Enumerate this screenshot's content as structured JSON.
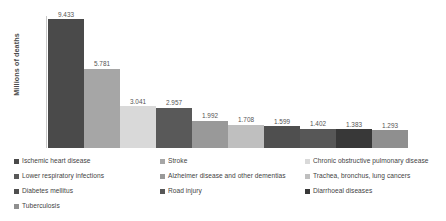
{
  "chart_data": {
    "type": "bar",
    "title": "",
    "subtitle": "",
    "xlabel": "",
    "ylabel": "Millions of deaths",
    "ylim": [
      0,
      10.5
    ],
    "grid": false,
    "legend_position": "bottom",
    "legend_columns": 3,
    "value_format": "decimal-comma-three",
    "categories": [
      "Ischemic heart disease",
      "Stroke",
      "Chronic obstructive pulmonary disease",
      "Lower respiratory infections",
      "Alzheimer disease and other dementias",
      "Trachea, bronchus, lung cancers",
      "Diabetes mellitus",
      "Road injury",
      "Diarrhoeal diseases",
      "Tuberculosis"
    ],
    "bars": [
      {
        "label": "Ischemic heart disease",
        "value": 9.433,
        "value_text": "9.433",
        "color": "#4a4a4a"
      },
      {
        "label": "Stroke",
        "value": 5.781,
        "value_text": "5.781",
        "color": "#a6a6a6"
      },
      {
        "label": "Chronic obstructive pulmonary disease",
        "value": 3.041,
        "value_text": "3.041",
        "color": "#d9d9d9"
      },
      {
        "label": "Lower respiratory infections",
        "value": 2.957,
        "value_text": "2.957",
        "color": "#595959"
      },
      {
        "label": "Alzheimer disease and other dementias",
        "value": 1.992,
        "value_text": "1.992",
        "color": "#999999"
      },
      {
        "label": "Trachea, bronchus, lung cancers",
        "value": 1.708,
        "value_text": "1.708",
        "color": "#bfbfbf"
      },
      {
        "label": "Diabetes mellitus",
        "value": 1.599,
        "value_text": "1.599",
        "color": "#4f4f4f"
      },
      {
        "label": "Road injury",
        "value": 1.402,
        "value_text": "1.402",
        "color": "#575757"
      },
      {
        "label": "Diarrhoeal diseases",
        "value": 1.383,
        "value_text": "1.383",
        "color": "#383838"
      },
      {
        "label": "Tuberculosis",
        "value": 1.293,
        "value_text": "1.293",
        "color": "#8f8f8f"
      }
    ]
  },
  "legend": {
    "columns": [
      {
        "items": [
          {
            "label": "Ischemic heart disease",
            "color": "#4a4a4a"
          },
          {
            "label": "Lower respiratory infections",
            "color": "#595959"
          },
          {
            "label": "Diabetes mellitus",
            "color": "#4f4f4f"
          },
          {
            "label": "Tuberculosis",
            "color": "#8f8f8f"
          }
        ]
      },
      {
        "items": [
          {
            "label": "Stroke",
            "color": "#a6a6a6"
          },
          {
            "label": "Alzheimer disease and other dementias",
            "color": "#999999"
          },
          {
            "label": "Road injury",
            "color": "#575757"
          }
        ]
      },
      {
        "items": [
          {
            "label": "Chronic obstructive pulmonary disease",
            "color": "#d9d9d9"
          },
          {
            "label": "Trachea, bronchus, lung cancers",
            "color": "#bfbfbf"
          },
          {
            "label": "Diarrhoeal diseases",
            "color": "#383838"
          }
        ]
      }
    ]
  },
  "axes": {
    "y_title": "Millions of deaths",
    "axis_color": "#c9c9c9"
  }
}
